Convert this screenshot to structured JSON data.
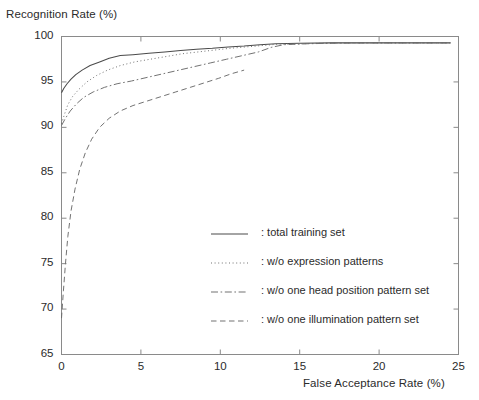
{
  "chart_data": {
    "type": "line",
    "title": "",
    "xlabel": "False Acceptance Rate (%)",
    "ylabel": "Recognition Rate (%)",
    "xlim": [
      0,
      25
    ],
    "ylim": [
      65,
      100
    ],
    "xticks": [
      0,
      5,
      10,
      15,
      20,
      25
    ],
    "yticks": [
      65,
      70,
      75,
      80,
      85,
      90,
      95,
      100
    ],
    "xtick_labels": [
      "0",
      "5",
      "10",
      "15",
      "20",
      "25"
    ],
    "ytick_labels": [
      "65",
      "70",
      "75",
      "80",
      "85",
      "90",
      "95",
      "100"
    ],
    "grid": false,
    "legend_position": "center",
    "series": [
      {
        "name": "total training set",
        "legend_label": ": total training set",
        "style": "solid",
        "color": "#4a4a4a",
        "points": [
          [
            0.0,
            93.8
          ],
          [
            0.15,
            94.3
          ],
          [
            0.35,
            94.8
          ],
          [
            0.6,
            95.3
          ],
          [
            0.9,
            95.8
          ],
          [
            1.3,
            96.3
          ],
          [
            1.8,
            96.8
          ],
          [
            2.4,
            97.2
          ],
          [
            3.0,
            97.6
          ],
          [
            3.7,
            97.9
          ],
          [
            4.5,
            98.0
          ],
          [
            5.5,
            98.15
          ],
          [
            6.5,
            98.3
          ],
          [
            7.5,
            98.45
          ],
          [
            8.5,
            98.6
          ],
          [
            9.5,
            98.7
          ],
          [
            10.5,
            98.85
          ],
          [
            11.5,
            98.95
          ],
          [
            12.5,
            99.1
          ],
          [
            13.5,
            99.2
          ],
          [
            15.0,
            99.25
          ],
          [
            17.0,
            99.3
          ],
          [
            19.0,
            99.3
          ],
          [
            21.0,
            99.3
          ],
          [
            23.0,
            99.3
          ],
          [
            24.5,
            99.3
          ]
        ]
      },
      {
        "name": "w/o expression patterns",
        "legend_label": ": w/o expression patterns",
        "style": "dotted",
        "color": "#6a6a6a",
        "points": [
          [
            0.0,
            90.4
          ],
          [
            0.2,
            91.5
          ],
          [
            0.4,
            92.5
          ],
          [
            0.7,
            93.4
          ],
          [
            1.1,
            94.2
          ],
          [
            1.6,
            95.0
          ],
          [
            2.2,
            95.7
          ],
          [
            2.9,
            96.3
          ],
          [
            3.7,
            96.8
          ],
          [
            4.6,
            97.2
          ],
          [
            5.6,
            97.5
          ],
          [
            6.6,
            97.8
          ],
          [
            7.6,
            98.1
          ],
          [
            8.6,
            98.3
          ],
          [
            9.6,
            98.5
          ],
          [
            10.6,
            98.7
          ],
          [
            11.6,
            98.85
          ],
          [
            12.6,
            99.0
          ],
          [
            13.6,
            99.15
          ],
          [
            15.0,
            99.2
          ],
          [
            17.0,
            99.28
          ],
          [
            19.0,
            99.3
          ],
          [
            21.0,
            99.3
          ],
          [
            23.0,
            99.3
          ],
          [
            24.5,
            99.3
          ]
        ]
      },
      {
        "name": "w/o one head position pattern set",
        "legend_label": ": w/o one head position pattern set",
        "style": "dashdot",
        "color": "#6a6a6a",
        "points": [
          [
            0.0,
            90.2
          ],
          [
            0.25,
            91.0
          ],
          [
            0.55,
            91.8
          ],
          [
            0.95,
            92.6
          ],
          [
            1.4,
            93.3
          ],
          [
            2.0,
            93.9
          ],
          [
            2.7,
            94.4
          ],
          [
            3.5,
            94.8
          ],
          [
            4.4,
            95.1
          ],
          [
            5.4,
            95.5
          ],
          [
            6.4,
            95.9
          ],
          [
            7.4,
            96.3
          ],
          [
            8.4,
            96.7
          ],
          [
            9.4,
            97.1
          ],
          [
            10.4,
            97.5
          ],
          [
            11.4,
            97.9
          ],
          [
            12.4,
            98.3
          ],
          [
            13.2,
            98.8
          ],
          [
            14.0,
            99.1
          ],
          [
            15.5,
            99.2
          ],
          [
            17.5,
            99.28
          ],
          [
            19.5,
            99.3
          ],
          [
            21.5,
            99.3
          ],
          [
            23.5,
            99.3
          ],
          [
            24.5,
            99.3
          ]
        ]
      },
      {
        "name": "w/o one illumination pattern set",
        "legend_label": ": w/o one illumination pattern set",
        "style": "dashed",
        "color": "#6a6a6a",
        "points": [
          [
            0.0,
            69.0
          ],
          [
            0.12,
            72.0
          ],
          [
            0.25,
            75.0
          ],
          [
            0.4,
            78.0
          ],
          [
            0.6,
            80.8
          ],
          [
            0.85,
            83.2
          ],
          [
            1.15,
            85.4
          ],
          [
            1.5,
            87.2
          ],
          [
            1.9,
            88.7
          ],
          [
            2.4,
            90.0
          ],
          [
            3.0,
            91.0
          ],
          [
            3.7,
            91.8
          ],
          [
            4.5,
            92.4
          ],
          [
            5.4,
            92.9
          ],
          [
            6.3,
            93.4
          ],
          [
            7.2,
            93.9
          ],
          [
            8.1,
            94.4
          ],
          [
            9.0,
            94.9
          ],
          [
            9.9,
            95.4
          ],
          [
            10.7,
            95.9
          ],
          [
            11.5,
            96.3
          ]
        ]
      }
    ]
  },
  "figure": {
    "axis_color": "#8a8a8a",
    "background": "#ffffff"
  }
}
